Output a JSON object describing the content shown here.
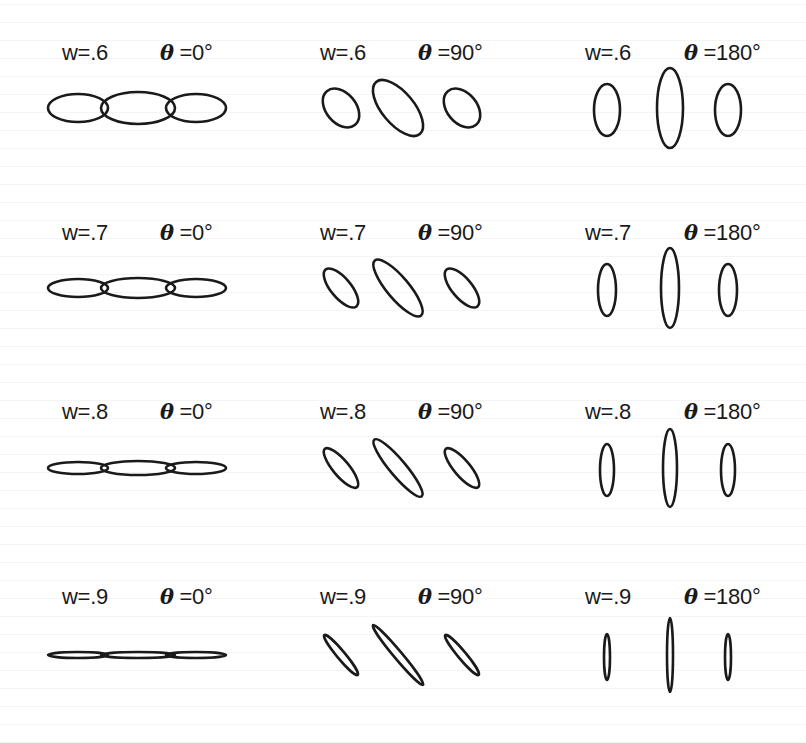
{
  "figure": {
    "columns": [
      {
        "theta_label": "=0°",
        "theta_deg": 0
      },
      {
        "theta_label": "=90°",
        "theta_deg": 90
      },
      {
        "theta_label": "=180°",
        "theta_deg": 180
      }
    ],
    "rows": [
      {
        "w_label": "w=.6",
        "w": 0.6
      },
      {
        "w_label": "w=.7",
        "w": 0.7
      },
      {
        "w_label": "w=.8",
        "w": 0.8
      },
      {
        "w_label": "w=.9",
        "w": 0.9
      }
    ],
    "theta_symbol": "θ",
    "stroke_color": "#1a1a1a",
    "background_color": "#ffffff"
  }
}
